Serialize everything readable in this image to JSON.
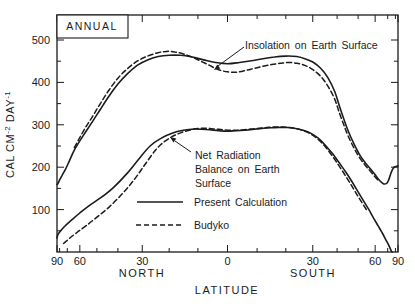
{
  "figure": {
    "title": "ANNUAL",
    "x_axis": {
      "label": "LATITUDE",
      "north_label": "NORTH",
      "south_label": "SOUTH",
      "tick_labels": [
        "90",
        "60",
        "30",
        "0",
        "30",
        "60",
        "90"
      ],
      "tick_lats": [
        -90,
        -60,
        -30,
        0,
        30,
        60,
        90
      ],
      "minor_step_deg": 10,
      "scale": "sine-latitude"
    },
    "y_axis": {
      "label_plain": "CAL CM-2 DAY-1",
      "label_parts": [
        {
          "t": "CAL CM"
        },
        {
          "t": "-2",
          "sup": true
        },
        {
          "t": " DAY"
        },
        {
          "t": "-1",
          "sup": true
        }
      ],
      "major_ticks": [
        100,
        200,
        300,
        400,
        500
      ],
      "minor_ticks": [
        50,
        150,
        250,
        350,
        450
      ],
      "range": [
        0,
        500
      ]
    },
    "annotations": {
      "insolation": "Insolation on Earth Surface",
      "net_radiation_lines": [
        "Net Radiation",
        "Balance on Earth",
        "Surface"
      ]
    },
    "legend": [
      {
        "style": "solid",
        "label": "Present Calculation"
      },
      {
        "style": "dashed",
        "label": "Budyko"
      }
    ],
    "colors": {
      "ink": "#1b1b1b",
      "paper": "#ffffff"
    }
  },
  "chart_data": {
    "type": "line",
    "title": "ANNUAL",
    "xlabel": "LATITUDE",
    "ylabel": "CAL CM-2 DAY-1",
    "x_convention": "degrees latitude; negative = North, positive = South; horizontal position proportional to sin(latitude)",
    "xlim_deg": [
      -90,
      90
    ],
    "ylim": [
      0,
      500
    ],
    "grid": false,
    "legend_position": "lower-center-inside",
    "series": [
      {
        "name": "Insolation on Earth Surface - Present Calculation",
        "line": "solid",
        "points": [
          [
            -90,
            160
          ],
          [
            -87,
            159
          ],
          [
            -84,
            161
          ],
          [
            -80,
            170
          ],
          [
            -76,
            181
          ],
          [
            -72,
            194
          ],
          [
            -68,
            215
          ],
          [
            -64,
            240
          ],
          [
            -60,
            262
          ],
          [
            -56,
            285
          ],
          [
            -52,
            310
          ],
          [
            -48,
            338
          ],
          [
            -44,
            368
          ],
          [
            -40,
            396
          ],
          [
            -36,
            420
          ],
          [
            -32,
            440
          ],
          [
            -28,
            453
          ],
          [
            -24,
            461
          ],
          [
            -20,
            464
          ],
          [
            -16,
            464
          ],
          [
            -12,
            460
          ],
          [
            -8,
            453
          ],
          [
            -4,
            447
          ],
          [
            0,
            444
          ],
          [
            4,
            447
          ],
          [
            8,
            451
          ],
          [
            12,
            456
          ],
          [
            16,
            460
          ],
          [
            20,
            462
          ],
          [
            24,
            461
          ],
          [
            27,
            456
          ],
          [
            30,
            448
          ],
          [
            33,
            434
          ],
          [
            36,
            412
          ],
          [
            39,
            378
          ],
          [
            41,
            344
          ],
          [
            43,
            314
          ],
          [
            45,
            286
          ],
          [
            48,
            254
          ],
          [
            51,
            228
          ],
          [
            54,
            210
          ],
          [
            57,
            196
          ],
          [
            60,
            182
          ],
          [
            63,
            169
          ],
          [
            66,
            161
          ],
          [
            69,
            162
          ],
          [
            71,
            170
          ],
          [
            73,
            183
          ],
          [
            75,
            193
          ],
          [
            78,
            200
          ],
          [
            82,
            202
          ],
          [
            86,
            203
          ],
          [
            90,
            203
          ]
        ]
      },
      {
        "name": "Insolation on Earth Surface - Budyko",
        "line": "dashed",
        "points": [
          [
            -64,
            246
          ],
          [
            -60,
            270
          ],
          [
            -56,
            296
          ],
          [
            -52,
            322
          ],
          [
            -48,
            352
          ],
          [
            -44,
            382
          ],
          [
            -40,
            410
          ],
          [
            -36,
            432
          ],
          [
            -32,
            450
          ],
          [
            -28,
            462
          ],
          [
            -24,
            470
          ],
          [
            -21,
            473
          ],
          [
            -18,
            472
          ],
          [
            -15,
            467
          ],
          [
            -12,
            460
          ],
          [
            -9,
            450
          ],
          [
            -6,
            440
          ],
          [
            -3,
            430
          ],
          [
            0,
            425
          ],
          [
            3,
            424
          ],
          [
            6,
            428
          ],
          [
            9,
            433
          ],
          [
            12,
            438
          ],
          [
            15,
            442
          ],
          [
            18,
            445
          ],
          [
            21,
            447
          ],
          [
            24,
            445
          ],
          [
            27,
            440
          ],
          [
            30,
            430
          ],
          [
            33,
            415
          ],
          [
            36,
            392
          ],
          [
            39,
            360
          ],
          [
            41,
            328
          ],
          [
            43,
            300
          ],
          [
            45,
            274
          ],
          [
            48,
            244
          ],
          [
            51,
            221
          ],
          [
            54,
            204
          ],
          [
            57,
            190
          ],
          [
            60,
            177
          ],
          [
            63,
            166
          ]
        ]
      },
      {
        "name": "Net Radiation Balance on Earth Surface - Present Calculation",
        "line": "solid",
        "points": [
          [
            -90,
            33
          ],
          [
            -84,
            41
          ],
          [
            -78,
            50
          ],
          [
            -72,
            62
          ],
          [
            -66,
            76
          ],
          [
            -60,
            92
          ],
          [
            -54,
            110
          ],
          [
            -48,
            128
          ],
          [
            -42,
            152
          ],
          [
            -36,
            186
          ],
          [
            -31,
            222
          ],
          [
            -27,
            250
          ],
          [
            -23,
            268
          ],
          [
            -19,
            280
          ],
          [
            -15,
            287
          ],
          [
            -11,
            290
          ],
          [
            -7,
            289
          ],
          [
            -3,
            286
          ],
          [
            0,
            285
          ],
          [
            3,
            286
          ],
          [
            7,
            288
          ],
          [
            11,
            291
          ],
          [
            15,
            293
          ],
          [
            19,
            294
          ],
          [
            23,
            292
          ],
          [
            26,
            288
          ],
          [
            29,
            281
          ],
          [
            32,
            269
          ],
          [
            35,
            252
          ],
          [
            38,
            232
          ],
          [
            41,
            210
          ],
          [
            44,
            188
          ],
          [
            47,
            165
          ],
          [
            50,
            142
          ],
          [
            53,
            120
          ],
          [
            56,
            100
          ],
          [
            59,
            80
          ],
          [
            62,
            62
          ],
          [
            65,
            46
          ],
          [
            68,
            30
          ],
          [
            71,
            16
          ],
          [
            74,
            2
          ],
          [
            75,
            0
          ]
        ]
      },
      {
        "name": "Net Radiation Balance on Earth Surface - Budyko",
        "line": "dashed",
        "points": [
          [
            -74,
            20
          ],
          [
            -68,
            32
          ],
          [
            -62,
            46
          ],
          [
            -56,
            62
          ],
          [
            -50,
            82
          ],
          [
            -44,
            106
          ],
          [
            -38,
            138
          ],
          [
            -33,
            172
          ],
          [
            -29,
            206
          ],
          [
            -25,
            240
          ],
          [
            -22,
            259
          ],
          [
            -19,
            272
          ],
          [
            -16,
            281
          ],
          [
            -13,
            287
          ],
          [
            -10,
            291
          ],
          [
            -7,
            292
          ],
          [
            -4,
            290
          ],
          [
            -1,
            288
          ],
          [
            2,
            287
          ],
          [
            5,
            288
          ],
          [
            8,
            290
          ],
          [
            11,
            292
          ],
          [
            14,
            294
          ],
          [
            17,
            295
          ],
          [
            20,
            294
          ],
          [
            23,
            292
          ],
          [
            26,
            287
          ],
          [
            29,
            279
          ],
          [
            32,
            266
          ],
          [
            35,
            248
          ],
          [
            38,
            226
          ],
          [
            41,
            202
          ],
          [
            44,
            178
          ],
          [
            47,
            154
          ],
          [
            50,
            131
          ],
          [
            53,
            110
          ],
          [
            55,
            97
          ]
        ]
      }
    ]
  }
}
